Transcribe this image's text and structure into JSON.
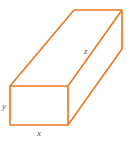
{
  "diagram": {
    "type": "rectangular-prism",
    "stroke_color": "#e87722",
    "labels": {
      "width": "x",
      "height": "y",
      "length": "z"
    }
  }
}
